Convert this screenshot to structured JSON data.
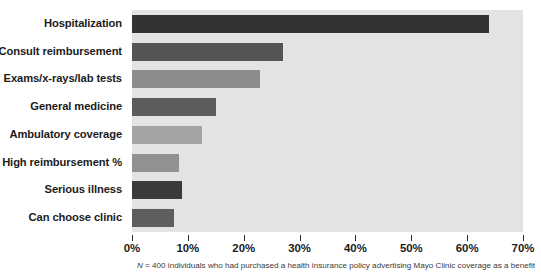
{
  "chart_data": {
    "type": "bar",
    "orientation": "horizontal",
    "title": "",
    "subtitle": "",
    "xlabel": "",
    "ylabel": "",
    "categories": [
      "Hospitalization",
      "Consult reimbursement",
      "Exams/x-rays/lab tests",
      "General medicine",
      "Ambulatory coverage",
      "High reimbursement %",
      "Serious illness",
      "Can choose clinic"
    ],
    "values": [
      64,
      27,
      23,
      15,
      12.5,
      8.5,
      9,
      7.5
    ],
    "bar_colors": [
      "#333333",
      "#555555",
      "#8c8c8c",
      "#5c5c5c",
      "#a3a3a3",
      "#919191",
      "#3a3a3a",
      "#5e5e5e"
    ],
    "xlim": [
      0,
      70
    ],
    "xticks": [
      0,
      10,
      20,
      30,
      40,
      50,
      60,
      70
    ],
    "xtick_labels": [
      "0%",
      "10%",
      "20%",
      "30%",
      "40%",
      "50%",
      "60%",
      "70%"
    ],
    "grid": false,
    "legend": null,
    "plot_background": "#e3e3e3",
    "figure_background": "#ffffff",
    "annotations": [],
    "caption": {
      "prefix_italic": "N",
      "text": " = 400 individuals who had purchased a health insurance policy advertising Mayo Clinic coverage as a benefit",
      "full": "N = 400 individuals who had purchased a health insurance policy advertising Mayo Clinic coverage as a benefit"
    }
  }
}
